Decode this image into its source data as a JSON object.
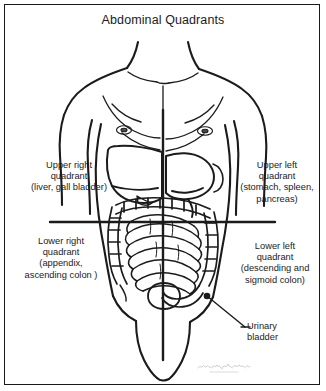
{
  "figure": {
    "title": "Abdominal Quadrants",
    "border_color": "#1a1a1a",
    "background_color": "#ffffff",
    "ink_color": "#1b1b1b",
    "signature_note": "illegible artist signature watermark"
  },
  "labels": {
    "upper_right": "Upper right\nquadrant\n(liver, gall bladder)",
    "upper_left": "Upper left\nquadrant\n(stomach, spleen,\npancreas)",
    "lower_right": "Lower right\nquadrant\n(appendix,\nascending colon )",
    "lower_left": "Lower left\nquadrant\n(descending and\nsigmoid colon)",
    "bladder": "Urinary\nbladder"
  },
  "diagram": {
    "quadrant_axes": {
      "vertical_x": 163,
      "vertical_y_start": 110,
      "vertical_y_end": 360,
      "horizontal_y": 222,
      "horizontal_x_start": 50,
      "horizontal_x_end": 275
    },
    "organs": [
      "liver",
      "gall bladder",
      "stomach",
      "spleen",
      "pancreas",
      "small intestine",
      "ascending colon",
      "descending colon",
      "sigmoid colon",
      "appendix",
      "urinary bladder"
    ],
    "bladder_marker": {
      "x": 207,
      "y": 296
    },
    "bladder_leader_end": {
      "x": 245,
      "y": 327
    }
  }
}
